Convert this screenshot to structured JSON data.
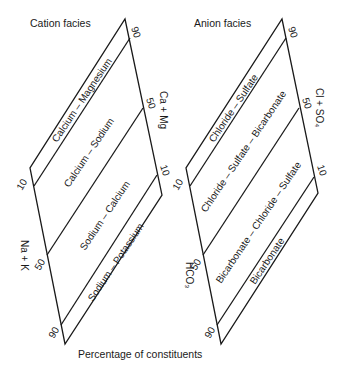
{
  "diagram": {
    "caption": "Percentage of constituents",
    "cation": {
      "title": "Cation facies",
      "axis_right": "Ca + Mg",
      "axis_left": "Na + K",
      "ticks_right": [
        "90",
        "50",
        "10"
      ],
      "ticks_left": [
        "10",
        "50",
        "90"
      ],
      "facies": [
        "Calcium – Magnesium",
        "Calcium – Sodium",
        "Sodium – Calcium",
        "Sodium – Potassium"
      ]
    },
    "anion": {
      "title": "Anion facies",
      "axis_right": "Cl + SO₄",
      "axis_left": "HCO₃",
      "ticks_right": [
        "90",
        "50",
        "10"
      ],
      "ticks_left": [
        "10",
        "50",
        "90"
      ],
      "facies": [
        "Chloride – Sulfate",
        "Chloride – Sulfate – Bicarbonate",
        "Bicarbonate – Chloride – Sulfate",
        "Bicarbonate"
      ]
    },
    "colors": {
      "ink": "#1a1a1a",
      "background": "#ffffff"
    }
  }
}
